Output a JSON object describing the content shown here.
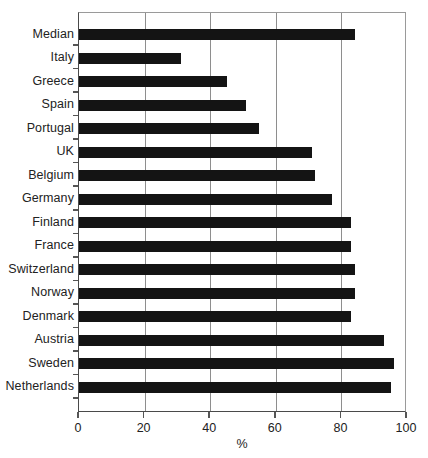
{
  "chart_data": {
    "type": "bar",
    "orientation": "horizontal",
    "title": "",
    "xlabel": "%",
    "ylabel": "",
    "xlim": [
      0,
      100
    ],
    "xticks": [
      0,
      20,
      40,
      60,
      80,
      100
    ],
    "xtick_labels": [
      "0",
      "20",
      "40",
      "60",
      "80",
      "100"
    ],
    "grid": "vertical",
    "legend": null,
    "bar_color": "#141414",
    "categories": [
      "Median",
      "Italy",
      "Greece",
      "Spain",
      "Portugal",
      "UK",
      "Belgium",
      "Germany",
      "Finland",
      "France",
      "Switzerland",
      "Norway",
      "Denmark",
      "Austria",
      "Sweden",
      "Netherlands"
    ],
    "values": [
      84,
      31,
      45,
      51,
      55,
      71,
      72,
      77,
      83,
      83,
      84,
      84,
      83,
      93,
      96,
      95
    ]
  }
}
